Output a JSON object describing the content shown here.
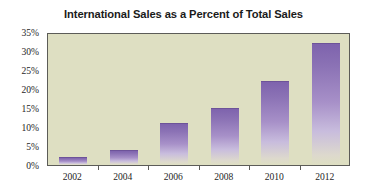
{
  "chart_data": {
    "type": "bar",
    "title": "International Sales as a Percent of Total Sales",
    "xlabel": "",
    "ylabel": "",
    "categories": [
      "2002",
      "2004",
      "2006",
      "2008",
      "2010",
      "2012"
    ],
    "values": [
      2,
      4,
      11,
      15,
      22,
      32
    ],
    "ylim": [
      0,
      35
    ],
    "ytick_labels": [
      "0%",
      "5%",
      "10%",
      "15%",
      "20%",
      "25%",
      "30%",
      "35%"
    ],
    "ytick_values": [
      0,
      5,
      10,
      15,
      20,
      25,
      30,
      35
    ],
    "grid": false,
    "legend": false,
    "series": [
      {
        "name": "International Sales as a Percent of Total Sales",
        "values": [
          2,
          4,
          11,
          15,
          22,
          32
        ]
      }
    ],
    "colors": {
      "bar_top": "#7e63ad",
      "bar_bottom": "#dedfc2",
      "plot_background": "#dedfc2",
      "axis_line": "#5c5c58",
      "title_text": "#1b1b1b",
      "tick_text": "#1f1f1f",
      "canvas_background": "#ffffff"
    }
  }
}
